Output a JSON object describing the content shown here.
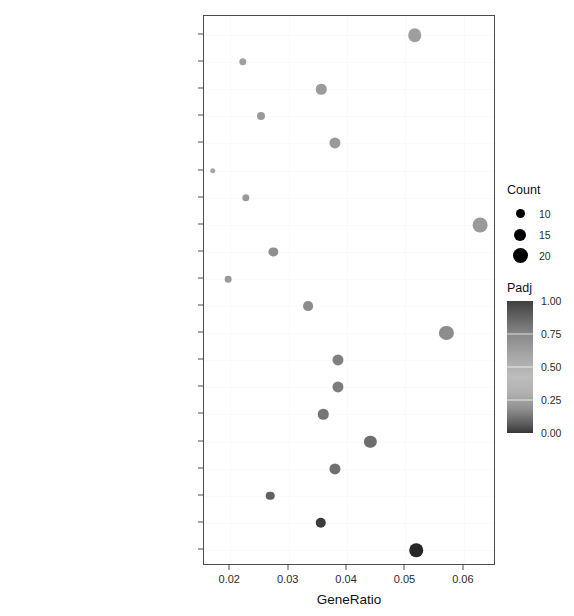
{
  "chart_data": {
    "type": "scatter",
    "title": "",
    "xlabel": "GeneRatio",
    "ylabel": "",
    "xlim": [
      0.0155,
      0.0655
    ],
    "xticks": [
      0.02,
      0.03,
      0.04,
      0.05,
      0.06
    ],
    "xticklabels": [
      "0.02",
      "0.03",
      "0.04",
      "0.05",
      "0.06"
    ],
    "grid": false,
    "legend_position": "right",
    "categories": [
      "Proteoglycans in cancer",
      "Arginine and proline metabolism",
      "Platelet activation",
      "Central carbon metabolism in cancer",
      "Osteoclast differentiation",
      "Pentose phosphate pathway",
      "Primary immunodeficiency",
      "Human T−cell leukemia virus 1 infection",
      "Bacterial invasion of epithelial cells",
      "Bladder cancer",
      "Small cell lung cancer",
      "Focal adhesion",
      "Carbon metabolism",
      "Leukocyte transendothelial migration",
      "Fc gamma R−mediated phagocytosis",
      "Neutrophil extracellular trap formation",
      "Hematopoietic cell lineage",
      "Glycolysis / Gluconeogenesis",
      "Biosynthesis of amino acids",
      "Cell cycle"
    ],
    "points": [
      {
        "label": "Proteoglycans in cancer",
        "gene_ratio": 0.0516,
        "count": 18,
        "padj": 0.62,
        "color": "#9e9e9e"
      },
      {
        "label": "Arginine and proline metabolism",
        "gene_ratio": 0.0221,
        "count": 8,
        "padj": 0.6,
        "color": "#a0a0a0"
      },
      {
        "label": "Platelet activation",
        "gene_ratio": 0.0356,
        "count": 13,
        "padj": 0.58,
        "color": "#9b9b9b"
      },
      {
        "label": "Central carbon metabolism in cancer",
        "gene_ratio": 0.0253,
        "count": 9,
        "padj": 0.57,
        "color": "#9a9a9a"
      },
      {
        "label": "Osteoclast differentiation",
        "gene_ratio": 0.038,
        "count": 14,
        "padj": 0.56,
        "color": "#9a9a9a"
      },
      {
        "label": "Pentose phosphate pathway",
        "gene_ratio": 0.017,
        "count": 5,
        "padj": 0.55,
        "color": "#a6a6a6"
      },
      {
        "label": "Primary immunodeficiency",
        "gene_ratio": 0.0227,
        "count": 8,
        "padj": 0.52,
        "color": "#999999"
      },
      {
        "label": "Human T−cell leukemia virus 1 infection",
        "gene_ratio": 0.0628,
        "count": 20,
        "padj": 0.5,
        "color": "#9a9a9a"
      },
      {
        "label": "Bacterial invasion of epithelial cells",
        "gene_ratio": 0.0274,
        "count": 11,
        "padj": 0.47,
        "color": "#8f8f8f"
      },
      {
        "label": "Bladder cancer",
        "gene_ratio": 0.0196,
        "count": 7,
        "padj": 0.45,
        "color": "#989898"
      },
      {
        "label": "Small cell lung cancer",
        "gene_ratio": 0.0333,
        "count": 12,
        "padj": 0.42,
        "color": "#8c8c8c"
      },
      {
        "label": "Focal adhesion",
        "gene_ratio": 0.057,
        "count": 19,
        "padj": 0.4,
        "color": "#8d8d8d"
      },
      {
        "label": "Carbon metabolism",
        "gene_ratio": 0.0385,
        "count": 14,
        "padj": 0.35,
        "color": "#808080"
      },
      {
        "label": "Leukocyte transendothelial migration",
        "gene_ratio": 0.0385,
        "count": 14,
        "padj": 0.32,
        "color": "#7d7d7d"
      },
      {
        "label": "Fc gamma R−mediated phagocytosis",
        "gene_ratio": 0.0359,
        "count": 13,
        "padj": 0.28,
        "color": "#757575"
      },
      {
        "label": "Neutrophil extracellular trap formation",
        "gene_ratio": 0.044,
        "count": 16,
        "padj": 0.25,
        "color": "#6e6e6e"
      },
      {
        "label": "Hematopoietic cell lineage",
        "gene_ratio": 0.0379,
        "count": 14,
        "padj": 0.22,
        "color": "#6f6f6f"
      },
      {
        "label": "Glycolysis / Gluconeogenesis",
        "gene_ratio": 0.0268,
        "count": 10,
        "padj": 0.18,
        "color": "#616161"
      },
      {
        "label": "Biosynthesis of amino acids",
        "gene_ratio": 0.0355,
        "count": 13,
        "padj": 0.1,
        "color": "#3b3b3b"
      },
      {
        "label": "Cell cycle",
        "gene_ratio": 0.0518,
        "count": 18,
        "padj": 0.04,
        "color": "#262626"
      }
    ]
  },
  "legends": {
    "size": {
      "title": "Count",
      "entries": [
        {
          "value": "10",
          "px": 9
        },
        {
          "value": "15",
          "px": 12
        },
        {
          "value": "20",
          "px": 15
        }
      ]
    },
    "color": {
      "title": "Padj",
      "ticks": [
        "1.00",
        "0.75",
        "0.50",
        "0.25",
        "0.00"
      ],
      "range": [
        0.0,
        1.0
      ],
      "dark_color": "#363636",
      "light_color": "#bdbdbd"
    }
  }
}
